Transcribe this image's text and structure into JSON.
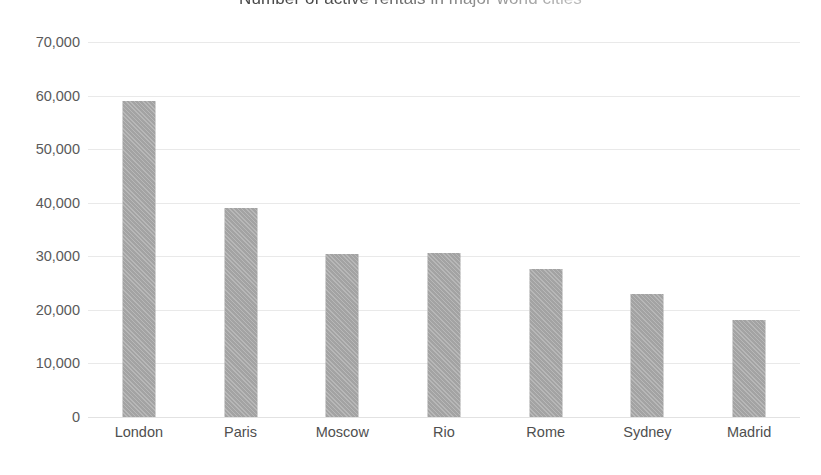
{
  "chart_data": {
    "type": "bar",
    "title": "Number of active rentals in major world cities",
    "xlabel": "",
    "ylabel": "",
    "categories": [
      "London",
      "Paris",
      "Moscow",
      "Rio",
      "Rome",
      "Sydney",
      "Madrid"
    ],
    "values": [
      59000,
      39000,
      30400,
      30600,
      27700,
      23000,
      18100
    ],
    "ylim": [
      0,
      70000
    ],
    "ytick_values": [
      0,
      10000,
      20000,
      30000,
      40000,
      50000,
      60000,
      70000
    ],
    "ytick_labels": [
      "0",
      "10,000",
      "20,000",
      "30,000",
      "40,000",
      "50,000",
      "60,000",
      "70,000"
    ],
    "grid": true,
    "grid_axis": "y",
    "legend": false,
    "legend_position": "none",
    "bar_color": "#a9a9a9",
    "gridline_color": "#e9e9e9",
    "background_color": "#ffffff",
    "text_color": "#4f4f4f",
    "title_clipped": true
  }
}
